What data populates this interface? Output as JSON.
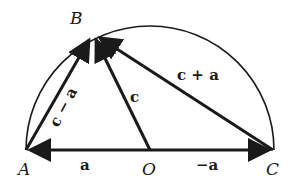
{
  "diagram": {
    "type": "geometry",
    "colors": {
      "stroke": "#1a1a1a",
      "background": "#ffffff"
    },
    "points": {
      "A": {
        "label": "A",
        "x": 26,
        "y": 150
      },
      "O": {
        "label": "O",
        "x": 150,
        "y": 150
      },
      "C": {
        "label": "C",
        "x": 273,
        "y": 150
      },
      "B": {
        "label": "B",
        "x": 93,
        "y": 35
      }
    },
    "vectors": [
      {
        "from": "O",
        "to": "A",
        "label": "a"
      },
      {
        "from": "O",
        "to": "C",
        "label": "−a"
      },
      {
        "from": "O",
        "to": "B",
        "label": "c"
      },
      {
        "from": "A",
        "to": "B",
        "label": "c − a"
      },
      {
        "from": "C",
        "to": "B",
        "label": "c + a"
      }
    ]
  }
}
